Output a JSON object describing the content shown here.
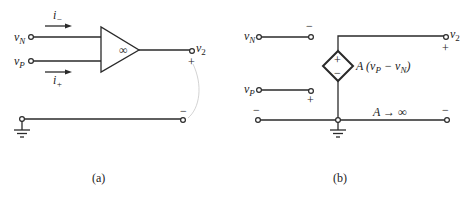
{
  "figure_a": {
    "caption": "(a)",
    "input_n_label": "v",
    "input_n_sub": "N",
    "input_p_label": "v",
    "input_p_sub": "P",
    "current_minus_label": "i",
    "current_minus_sub": "−",
    "current_plus_label": "i",
    "current_plus_sub": "+",
    "opamp_gain": "∞",
    "output_label": "v",
    "output_sub": "2",
    "output_plus": "+",
    "output_minus": "−"
  },
  "figure_b": {
    "caption": "(b)",
    "input_n_label": "v",
    "input_n_sub": "N",
    "input_p_label": "v",
    "input_p_sub": "P",
    "n_terminal_sign": "−",
    "p_terminal_sign": "+",
    "source_plus": "+",
    "source_minus": "−",
    "source_expr_prefix": "A (v",
    "source_expr_sub1": "P",
    "source_expr_mid": " − v",
    "source_expr_sub2": "N",
    "source_expr_suffix": ")",
    "output_label": "v",
    "output_sub": "2",
    "output_plus": "+",
    "left_minus": "−",
    "right_minus": "−",
    "gain_note": "A → ∞"
  }
}
